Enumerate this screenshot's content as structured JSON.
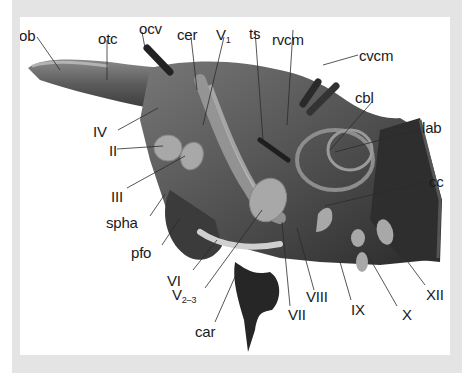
{
  "figure": {
    "type": "anatomical-reconstruction",
    "colors": {
      "frame_border": "#e4e4e4",
      "panel_bg": "#ffffff",
      "endocast_dark": "#3a3a3a",
      "endocast_mid": "#7a7a7a",
      "nerve_stub": "#a6a6a6",
      "label_text": "#1a1a1a"
    }
  },
  "labels": {
    "ob": "ob",
    "otc": "otc",
    "ocv": "ocv",
    "cer": "cer",
    "V1_main": "V",
    "V1_sub": "1",
    "ts": "ts",
    "rvcm": "rvcm",
    "cvcm": "cvcm",
    "cbl": "cbl",
    "lab": "lab",
    "cc": "cc",
    "IV": "IV",
    "II": "II",
    "III": "III",
    "spha": "spha",
    "pfo": "pfo",
    "VI": "VI",
    "V23_main": "V",
    "V23_sub": "2–3",
    "car": "car",
    "VII": "VII",
    "VIII": "VIII",
    "IX": "IX",
    "X": "X",
    "XII": "XII"
  }
}
